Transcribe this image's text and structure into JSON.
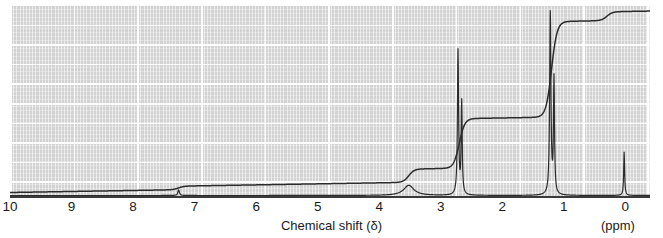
{
  "axis": {
    "title": "Chemical shift (δ)",
    "unit_label": "(ppm)",
    "ticks": [
      {
        "label": "10",
        "value": 10
      },
      {
        "label": "9",
        "value": 9
      },
      {
        "label": "8",
        "value": 8
      },
      {
        "label": "7",
        "value": 7
      },
      {
        "label": "6",
        "value": 6
      },
      {
        "label": "5",
        "value": 5
      },
      {
        "label": "4",
        "value": 4
      },
      {
        "label": "3",
        "value": 3
      },
      {
        "label": "2",
        "value": 2
      },
      {
        "label": "1",
        "value": 1
      },
      {
        "label": "0",
        "value": 0
      }
    ]
  },
  "colors": {
    "plot_background": "#d2d2d2",
    "gridline": "#ffffff",
    "trace": "#2b2b2b",
    "integration": "#2b2b2b",
    "axis": "#3a3a3a",
    "text": "#1a1a1a",
    "page_background": "#ffffff"
  },
  "chart_data": {
    "type": "line",
    "title": "",
    "xlabel": "Chemical shift (δ)",
    "ylabel": "",
    "xlim": [
      10,
      -0.4
    ],
    "ylim": [
      0,
      1
    ],
    "grid": true,
    "legend": "none",
    "x_axis_inverted": true,
    "series": [
      {
        "name": "1H NMR spectrum",
        "kind": "spectrum",
        "peaks": [
          {
            "shift": 7.26,
            "height": 0.03,
            "width": 0.03,
            "label": "CHCl3 residual",
            "shape": "singlet"
          },
          {
            "shift": 3.52,
            "height": 0.055,
            "width": 0.2,
            "label": "broad OH / CH",
            "shape": "broad"
          },
          {
            "shift": 2.72,
            "height": 0.78,
            "width": 0.022,
            "label": "CH",
            "shape": "multiplet"
          },
          {
            "shift": 2.66,
            "height": 0.5,
            "width": 0.02,
            "label": "CH",
            "shape": "multiplet"
          },
          {
            "shift": 1.22,
            "height": 1.0,
            "width": 0.024,
            "label": "CH3",
            "shape": "singlet"
          },
          {
            "shift": 1.16,
            "height": 0.62,
            "width": 0.02,
            "label": "CH3",
            "shape": "singlet"
          },
          {
            "shift": 0.02,
            "height": 0.235,
            "width": 0.018,
            "label": "TMS reference",
            "shape": "singlet"
          }
        ]
      },
      {
        "name": "Integration curve",
        "kind": "integral",
        "steps": [
          {
            "shift": 7.26,
            "rise": 0.02
          },
          {
            "shift": 3.52,
            "rise": 0.075
          },
          {
            "shift": 2.7,
            "rise": 0.28
          },
          {
            "shift": 1.2,
            "rise": 0.54
          },
          {
            "shift": 0.3,
            "rise": 0.05
          }
        ],
        "baseline_offset": 0.02,
        "drift_start": 0.0,
        "drift_end": 0.06
      }
    ]
  }
}
